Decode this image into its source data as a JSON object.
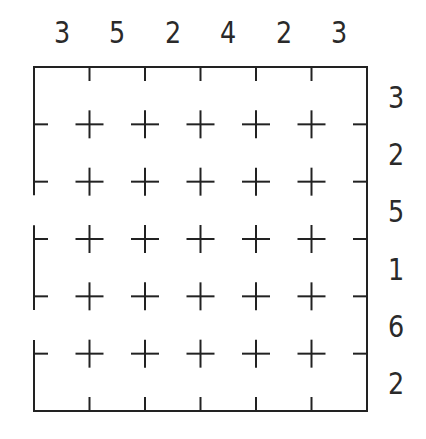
{
  "puzzle": {
    "type": "skyscrapers-style grid",
    "size": {
      "rows": 6,
      "cols": 6
    },
    "top_clues": [
      "3",
      "5",
      "2",
      "4",
      "2",
      "3"
    ],
    "right_clues": [
      "3",
      "2",
      "5",
      "1",
      "6",
      "2"
    ],
    "left_wall_openings": [
      {
        "row": 3,
        "label": "opening-row-3"
      },
      {
        "row": 5,
        "label": "opening-row-5"
      }
    ],
    "colors": {
      "stroke": "#222222",
      "text": "#2a2a2a",
      "background": "#ffffff"
    }
  }
}
